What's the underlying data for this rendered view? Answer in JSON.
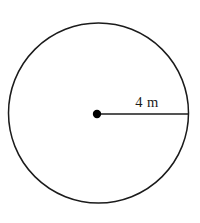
{
  "figure": {
    "type": "circle-with-radius-diagram",
    "background_color": "#ffffff",
    "stroke_color": "#1b1b1b",
    "circle": {
      "center_x": 98.5,
      "center_y": 113,
      "radius_px": 90,
      "stroke_width": 1.5
    },
    "center_point": {
      "x": 97,
      "y": 114,
      "dot_radius_px": 4.2,
      "fill": "#000000"
    },
    "radius_segment": {
      "x1": 97,
      "y1": 114,
      "x2": 188,
      "y2": 114,
      "stroke_width": 1.5
    },
    "radius_label": {
      "text": "4 m",
      "value": "4",
      "unit": "m",
      "x": 147,
      "y": 107
    }
  }
}
